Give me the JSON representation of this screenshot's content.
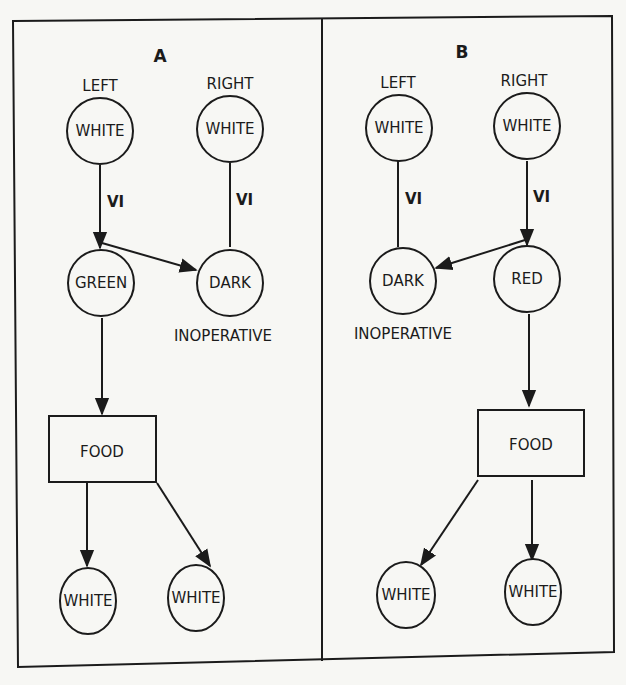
{
  "diagram": {
    "colors": {
      "ink": "#1b1b1b",
      "paper": "#f7f7f4"
    },
    "panels": [
      {
        "title": "A",
        "header_labels": {
          "left": "LEFT",
          "right": "RIGHT"
        },
        "nodes": {
          "left_top": "WHITE",
          "right_top": "WHITE",
          "mid_left": "GREEN",
          "mid_right": "DARK",
          "food": "FOOD",
          "bottom_left": "WHITE",
          "bottom_right": "WHITE"
        },
        "edge_labels": {
          "left": "VI",
          "right": "VI"
        },
        "status_label": "INOPERATIVE"
      },
      {
        "title": "B",
        "header_labels": {
          "left": "LEFT",
          "right": "RIGHT"
        },
        "nodes": {
          "left_top": "WHITE",
          "right_top": "WHITE",
          "mid_left": "DARK",
          "mid_right": "RED",
          "food": "FOOD",
          "bottom_left": "WHITE",
          "bottom_right": "WHITE"
        },
        "edge_labels": {
          "left": "VI",
          "right": "VI"
        },
        "status_label": "INOPERATIVE"
      }
    ],
    "edges": [
      {
        "panel": "A",
        "from": "LEFT WHITE",
        "to": "GREEN",
        "label": "VI",
        "arrow": true
      },
      {
        "panel": "A",
        "from": "RIGHT WHITE",
        "to": "DARK",
        "label": "VI",
        "arrow": false
      },
      {
        "panel": "A",
        "from": "GREEN",
        "to": "DARK",
        "arrow": true
      },
      {
        "panel": "A",
        "from": "GREEN",
        "to": "FOOD",
        "arrow": true
      },
      {
        "panel": "A",
        "from": "FOOD",
        "to": "WHITE (bottom left)",
        "arrow": true
      },
      {
        "panel": "A",
        "from": "FOOD",
        "to": "WHITE (bottom right)",
        "arrow": true
      },
      {
        "panel": "B",
        "from": "LEFT WHITE",
        "to": "DARK",
        "label": "VI",
        "arrow": false
      },
      {
        "panel": "B",
        "from": "RIGHT WHITE",
        "to": "RED",
        "label": "VI",
        "arrow": true
      },
      {
        "panel": "B",
        "from": "RED",
        "to": "DARK",
        "arrow": true
      },
      {
        "panel": "B",
        "from": "RED",
        "to": "FOOD",
        "arrow": true
      },
      {
        "panel": "B",
        "from": "FOOD",
        "to": "WHITE (bottom left)",
        "arrow": true
      },
      {
        "panel": "B",
        "from": "FOOD",
        "to": "WHITE (bottom right)",
        "arrow": true
      }
    ]
  }
}
